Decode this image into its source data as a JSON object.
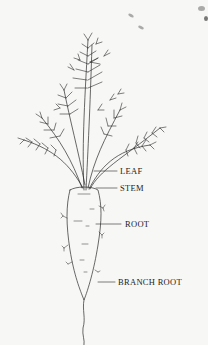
{
  "diagram": {
    "labels": [
      {
        "id": "leaf",
        "text": "LEAF",
        "x": 120,
        "y": 166
      },
      {
        "id": "stem",
        "text": "STEM",
        "x": 120,
        "y": 184
      },
      {
        "id": "root",
        "text": "ROOT",
        "x": 125,
        "y": 218
      },
      {
        "id": "branch-root",
        "text": "BRANCH ROOT",
        "x": 118,
        "y": 278
      }
    ],
    "colors": {
      "background": "#f7f7f6",
      "ink": "#2a2a2a"
    }
  }
}
